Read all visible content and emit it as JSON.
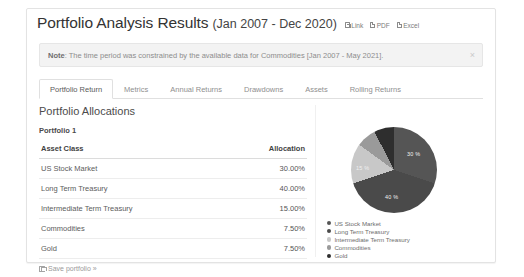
{
  "header": {
    "title": "Portfolio Analysis Results",
    "date_range": "(Jan 2007 - Dec 2020)",
    "links": [
      {
        "label": "Link",
        "icon": "external-link-icon"
      },
      {
        "label": "PDF",
        "icon": "document-icon"
      },
      {
        "label": "Excel",
        "icon": "document-icon"
      }
    ]
  },
  "note": {
    "prefix": "Note",
    "text": ": The time period was constrained by the available data for Commodities [Jan 2007 - May 2021].",
    "close_label": "×"
  },
  "tabs": [
    {
      "label": "Portfolio Return",
      "active": true
    },
    {
      "label": "Metrics",
      "active": false
    },
    {
      "label": "Annual Returns",
      "active": false
    },
    {
      "label": "Drawdowns",
      "active": false
    },
    {
      "label": "Assets",
      "active": false
    },
    {
      "label": "Rolling Returns",
      "active": false
    }
  ],
  "main": {
    "section_title": "Portfolio Allocations",
    "portfolio_name": "Portfolio 1",
    "table": {
      "columns": [
        "Asset Class",
        "Allocation"
      ],
      "rows": [
        {
          "asset": "US Stock Market",
          "allocation": "30.00%"
        },
        {
          "asset": "Long Term Treasury",
          "allocation": "40.00%"
        },
        {
          "asset": "Intermediate Term Treasury",
          "allocation": "15.00%"
        },
        {
          "asset": "Commodities",
          "allocation": "7.50%"
        },
        {
          "asset": "Gold",
          "allocation": "7.50%"
        }
      ]
    },
    "save_link": "Save portfolio »"
  },
  "chart_data": {
    "type": "pie",
    "title": "",
    "categories": [
      "US Stock Market",
      "Long Term Treasury",
      "Intermediate Term Treasury",
      "Commodities",
      "Gold"
    ],
    "values": [
      30.0,
      40.0,
      15.0,
      7.5,
      7.5
    ],
    "slice_labels": [
      "30 %",
      "40 %",
      "15 %"
    ],
    "colors": [
      "#555555",
      "#4a4a4a",
      "#c8c8c8",
      "#9a9a9a",
      "#2e2e2e"
    ],
    "legend_position": "bottom",
    "legend": [
      "US Stock Market",
      "Long Term Treasury",
      "Intermediate Term Treasury",
      "Commodities",
      "Gold"
    ]
  }
}
